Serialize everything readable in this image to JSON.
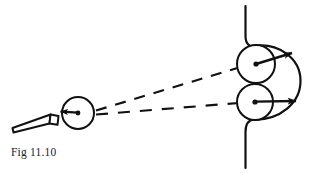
{
  "figure": {
    "caption": "Fig 11.10",
    "title": "Fig 11.10",
    "stroke_color": "#111111",
    "background_color": "#ffffff"
  },
  "elements": {
    "cue_stick": {
      "label": "cue stick",
      "tip_x": 57,
      "tip_y": 120,
      "butt_x": 12,
      "butt_y": 132
    },
    "cue_ball": {
      "label": "cue ball",
      "cx": 78,
      "cy": 113,
      "r": 16,
      "arrow_label": "cue ball velocity",
      "arrow_direction": "left",
      "arrow_from_x": 78,
      "arrow_from_y": 113,
      "arrow_to_x": 60,
      "arrow_to_y": 112
    },
    "trajectories": [
      {
        "label": "upper dashed trajectory",
        "x1": 96,
        "y1": 110,
        "x2": 238,
        "y2": 68,
        "style": "dashed"
      },
      {
        "label": "lower dashed trajectory",
        "x1": 96,
        "y1": 114,
        "x2": 238,
        "y2": 103,
        "style": "dashed"
      }
    ],
    "upper_ball": {
      "label": "upper target ball",
      "cx": 256,
      "cy": 64,
      "r": 19,
      "arrow_label": "upper ball velocity",
      "arrow_direction": "right-up",
      "arrow_from_x": 256,
      "arrow_from_y": 64,
      "arrow_to_x": 296,
      "arrow_to_y": 52
    },
    "lower_ball": {
      "label": "lower target ball",
      "cx": 255,
      "cy": 102,
      "r": 18,
      "arrow_label": "lower ball velocity",
      "arrow_direction": "right",
      "arrow_from_x": 255,
      "arrow_from_y": 102,
      "arrow_to_x": 300,
      "arrow_to_y": 101
    },
    "pocket_boundary": {
      "label": "pocket boundary",
      "top_rail_x": 245,
      "top_rail_y_start": 6,
      "bottom_rail_x": 245,
      "bottom_rail_y_end": 168,
      "arc_apex_x": 300,
      "arc_apex_y": 80
    }
  }
}
